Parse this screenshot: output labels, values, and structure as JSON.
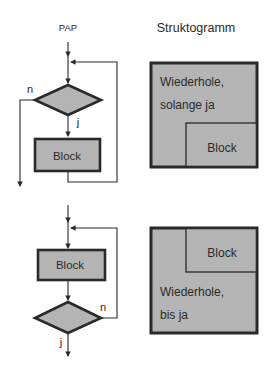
{
  "titles": {
    "left": "PAP",
    "right": "Struktogramm"
  },
  "colors": {
    "fill": "#b4b4b4",
    "stroke": "#2a2a2a",
    "background": "#ffffff"
  },
  "top_pap": {
    "label_no": "n",
    "label_yes": "j",
    "block_label": "Block",
    "type": "while-loop (kopfgesteuert)"
  },
  "top_struktogramm": {
    "condition_line1": "Wiederhole,",
    "condition_line2": "solange ja",
    "block_label": "Block"
  },
  "bottom_pap": {
    "label_no": "n",
    "label_yes": "j",
    "block_label": "Block",
    "type": "do-while-loop (fußgesteuert)"
  },
  "bottom_struktogramm": {
    "block_label": "Block",
    "condition_line1": "Wiederhole,",
    "condition_line2": "bis ja"
  }
}
